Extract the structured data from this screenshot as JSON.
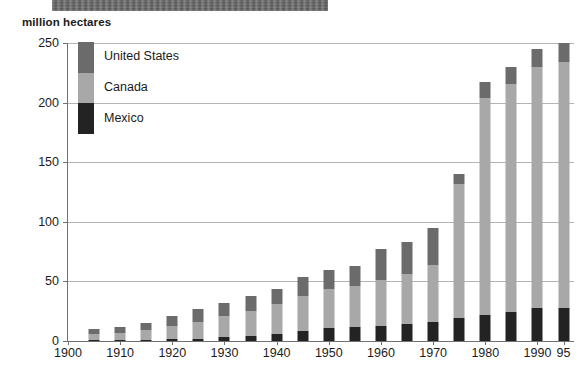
{
  "banner": {
    "text": "                                                  "
  },
  "axis_caption": "million hectares",
  "legend": {
    "entries": [
      {
        "label": "United States",
        "color": "#6b6b6b"
      },
      {
        "label": "Canada",
        "color": "#a8a8a8"
      },
      {
        "label": "Mexico",
        "color": "#232323"
      }
    ]
  },
  "chart_data": {
    "type": "bar",
    "title": "",
    "xlabel": "",
    "ylabel": "million hectares",
    "ylim": [
      0,
      250
    ],
    "yticks": [
      0,
      50,
      100,
      150,
      200,
      250
    ],
    "grid": true,
    "stacked": true,
    "legend_position": "top-left",
    "xtick_labels": [
      "1900",
      "1910",
      "1920",
      "1930",
      "1940",
      "1950",
      "1960",
      "1970",
      "1980",
      "1990",
      "95"
    ],
    "xtick_years": [
      1900,
      1910,
      1920,
      1930,
      1940,
      1950,
      1960,
      1970,
      1980,
      1990,
      1995
    ],
    "categories": [
      1905,
      1910,
      1915,
      1920,
      1925,
      1930,
      1935,
      1940,
      1945,
      1950,
      1955,
      1960,
      1965,
      1970,
      1975,
      1980,
      1985,
      1990,
      1995
    ],
    "series": [
      {
        "name": "Mexico",
        "color": "#232323",
        "values": [
          1,
          1,
          1,
          2,
          2,
          3,
          4,
          6,
          8,
          11,
          12,
          13,
          14,
          16,
          19,
          22,
          24,
          28,
          28
        ]
      },
      {
        "name": "Canada",
        "color": "#a8a8a8",
        "values": [
          5,
          6,
          8,
          11,
          14,
          18,
          21,
          25,
          30,
          33,
          34,
          38,
          42,
          48,
          113,
          182,
          192,
          202,
          206
        ]
      },
      {
        "name": "United States",
        "color": "#6b6b6b",
        "values": [
          4,
          5,
          6,
          8,
          11,
          11,
          13,
          13,
          16,
          16,
          17,
          26,
          27,
          31,
          8,
          13,
          14,
          15,
          16
        ]
      }
    ],
    "totals": [
      10,
      12,
      15,
      21,
      27,
      32,
      38,
      44,
      54,
      60,
      63,
      77,
      83,
      95,
      140,
      217,
      230,
      245,
      250
    ]
  }
}
